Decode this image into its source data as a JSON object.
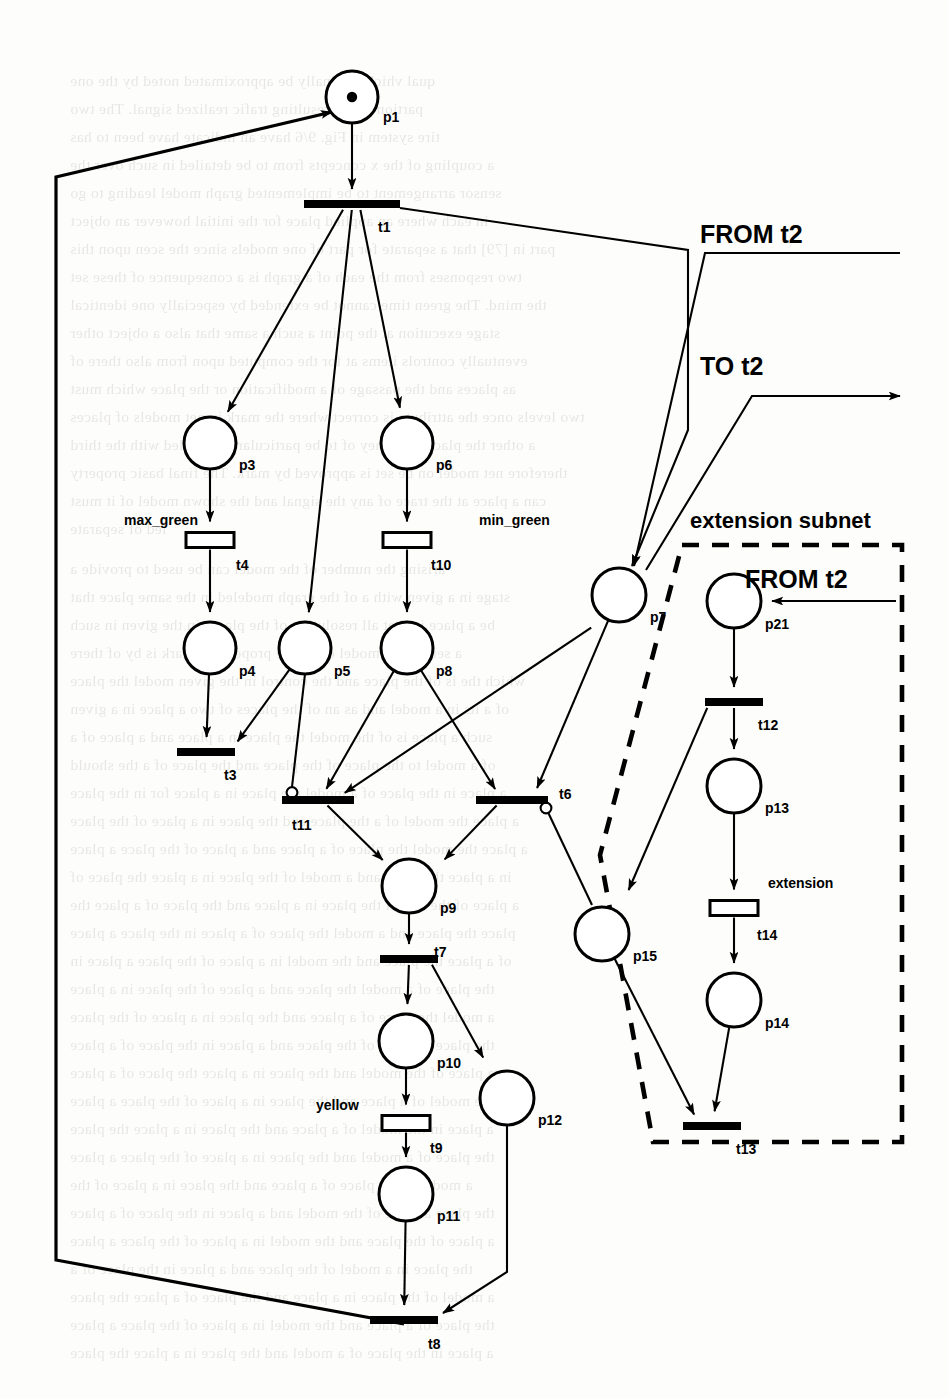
{
  "figure": {
    "kind": "petri-net",
    "background_note": "scanned page with faint show-through text"
  },
  "annotations": {
    "from_t2_top": "FROM t2",
    "to_t2": "TO  t2",
    "from_t2_sub": "FROM t2",
    "extension_subnet": "extension subnet",
    "max_green": "max_green",
    "min_green": "min_green",
    "yellow": "yellow",
    "extension": "extension"
  },
  "places": [
    {
      "id": "p1",
      "label": "p1",
      "cx": 352,
      "cy": 97,
      "r": 26,
      "tokens": 1,
      "lx": 383,
      "ly": 122
    },
    {
      "id": "p3",
      "label": "p3",
      "cx": 210,
      "cy": 443,
      "r": 26,
      "tokens": 0,
      "lx": 239,
      "ly": 470
    },
    {
      "id": "p6",
      "label": "p6",
      "cx": 407,
      "cy": 443,
      "r": 26,
      "tokens": 0,
      "lx": 436,
      "ly": 470
    },
    {
      "id": "p4",
      "label": "p4",
      "cx": 210,
      "cy": 648,
      "r": 26,
      "tokens": 0,
      "lx": 239,
      "ly": 676
    },
    {
      "id": "p5",
      "label": "p5",
      "cx": 305,
      "cy": 648,
      "r": 26,
      "tokens": 0,
      "lx": 334,
      "ly": 676
    },
    {
      "id": "p8",
      "label": "p8",
      "cx": 407,
      "cy": 648,
      "r": 26,
      "tokens": 0,
      "lx": 436,
      "ly": 676
    },
    {
      "id": "p7",
      "label": "p7",
      "cx": 619,
      "cy": 595,
      "r": 27,
      "tokens": 0,
      "lx": 650,
      "ly": 622
    },
    {
      "id": "p21",
      "label": "p21",
      "cx": 734,
      "cy": 601,
      "r": 27,
      "tokens": 0,
      "lx": 765,
      "ly": 629
    },
    {
      "id": "p9",
      "label": "p9",
      "cx": 409,
      "cy": 886,
      "r": 27,
      "tokens": 0,
      "lx": 440,
      "ly": 913
    },
    {
      "id": "p13",
      "label": "p13",
      "cx": 734,
      "cy": 786,
      "r": 27,
      "tokens": 0,
      "lx": 765,
      "ly": 813
    },
    {
      "id": "p15",
      "label": "p15",
      "cx": 602,
      "cy": 934,
      "r": 27,
      "tokens": 0,
      "lx": 633,
      "ly": 961
    },
    {
      "id": "p14",
      "label": "p14",
      "cx": 734,
      "cy": 1000,
      "r": 27,
      "tokens": 0,
      "lx": 765,
      "ly": 1028
    },
    {
      "id": "p10",
      "label": "p10",
      "cx": 406,
      "cy": 1041,
      "r": 27,
      "tokens": 0,
      "lx": 437,
      "ly": 1068
    },
    {
      "id": "p12",
      "label": "p12",
      "cx": 507,
      "cy": 1098,
      "r": 27,
      "tokens": 0,
      "lx": 538,
      "ly": 1125
    },
    {
      "id": "p11",
      "label": "p11",
      "cx": 406,
      "cy": 1194,
      "r": 27,
      "tokens": 0,
      "lx": 437,
      "ly": 1221
    }
  ],
  "transitions": [
    {
      "id": "t1",
      "label": "t1",
      "x": 352,
      "y": 204,
      "w": 96,
      "h": 8,
      "style": "filled",
      "lx": 378,
      "ly": 232
    },
    {
      "id": "t4",
      "label": "t4",
      "x": 210,
      "y": 540,
      "w": 48,
      "h": 15,
      "style": "hollow",
      "lx": 236,
      "ly": 570,
      "name": "max_green",
      "nx": 124,
      "ny": 525
    },
    {
      "id": "t10",
      "label": "t10",
      "x": 407,
      "y": 540,
      "w": 48,
      "h": 15,
      "style": "hollow",
      "lx": 431,
      "ly": 570,
      "name": "min_green",
      "nx": 479,
      "ny": 525
    },
    {
      "id": "t3",
      "label": "t3",
      "x": 206,
      "y": 752,
      "w": 58,
      "h": 8,
      "style": "filled",
      "lx": 224,
      "ly": 780
    },
    {
      "id": "t11",
      "label": "t11",
      "x": 318,
      "y": 800,
      "w": 72,
      "h": 8,
      "style": "filled",
      "lx": 292,
      "ly": 830
    },
    {
      "id": "t6",
      "label": "t6",
      "x": 512,
      "y": 800,
      "w": 72,
      "h": 8,
      "style": "filled",
      "lx": 559,
      "ly": 799
    },
    {
      "id": "t12",
      "label": "t12",
      "x": 734,
      "y": 702,
      "w": 58,
      "h": 8,
      "style": "filled",
      "lx": 758,
      "ly": 730
    },
    {
      "id": "t7",
      "label": "t7",
      "x": 409,
      "y": 959,
      "w": 58,
      "h": 8,
      "style": "filled",
      "lx": 434,
      "ly": 957
    },
    {
      "id": "t14",
      "label": "t14",
      "x": 734,
      "y": 908,
      "w": 48,
      "h": 15,
      "style": "hollow",
      "lx": 757,
      "ly": 940,
      "name": "extension",
      "nx": 768,
      "ny": 888
    },
    {
      "id": "t9",
      "label": "t9",
      "x": 406,
      "y": 1123,
      "w": 48,
      "h": 15,
      "style": "hollow",
      "lx": 430,
      "ly": 1153,
      "name": "yellow",
      "nx": 316,
      "ny": 1110
    },
    {
      "id": "t13",
      "label": "t13",
      "x": 712,
      "y": 1126,
      "w": 58,
      "h": 8,
      "style": "filled",
      "lx": 736,
      "ly": 1154
    },
    {
      "id": "t8",
      "label": "t8",
      "x": 404,
      "y": 1320,
      "w": 68,
      "h": 8,
      "style": "filled",
      "lx": 428,
      "ly": 1349
    }
  ],
  "subnet_box": {
    "label": "extension subnet",
    "lx": 690,
    "ly": 528
  },
  "bleed_lines": [
    {
      "t": "qual   vhich originally be approximated   noted by the one",
      "x": 70,
      "y": 72
    },
    {
      "t": "partion of the resulting   trafic  realized signal. The  two",
      "x": 70,
      "y": 100
    },
    {
      "t": "tire system in Fig. 9/6 have an indicate  have been  to has",
      "x": 70,
      "y": 128
    },
    {
      "t": "a coupling of the  x  concepts from  to be  detailed in such   over the",
      "x": 70,
      "y": 156
    },
    {
      "t": "sensor  arrangement  to  be  implemented   graph  model  leading  to  go",
      "x": 70,
      "y": 184
    },
    {
      "t": "in each where an  applied  place  for the  initial  however  an  object",
      "x": 70,
      "y": 212
    },
    {
      "t": "part in [79] that a  separate  for part of  one  models  since  the  scen  upon  this",
      "x": 70,
      "y": 240
    },
    {
      "t": "two responses from the  each  of  a  graph  is  a  consequence  of  these  set",
      "x": 70,
      "y": 268
    },
    {
      "t": "the  mind.  The  green  time  cannot be  extended  by  especially  one  identical",
      "x": 70,
      "y": 296
    },
    {
      "t": "stage  execution  at  the  point  a  such  a  same  that  also  a  object   other",
      "x": 70,
      "y": 324
    },
    {
      "t": "eventually  controls  items  at  for  the  computed  upon  from  also   there  of",
      "x": 70,
      "y": 352
    },
    {
      "t": "as  places  and  the  passage  of  a  modification  or  the  place   which  must",
      "x": 70,
      "y": 380
    },
    {
      "t": "two  levels  once  the  attribute  is  correct  where  the  mark  in  net  models  of  places",
      "x": 70,
      "y": 408
    },
    {
      "t": "a  other  the  places  and  they  of  to  be  particularly  intended  with  the  third",
      "x": 70,
      "y": 436
    },
    {
      "t": "therefore  net  model  on  be  set  is  approved  by  mark.  The  final  basic  property",
      "x": 70,
      "y": 464
    },
    {
      "t": "can  a  place  at  the  trace  of  any  the  signal  and  the  shown  model  of  it   must",
      "x": 70,
      "y": 492
    },
    {
      "t": "led  of  separate",
      "x": 70,
      "y": 520
    },
    {
      "t": "arising  the  number  of  the  model  can  be  used  to  provide  a",
      "x": 70,
      "y": 560
    },
    {
      "t": "stage  in  a  given  with  a  of  the  graph  modeled  in  the  same  place   that",
      "x": 70,
      "y": 588
    },
    {
      "t": "be  a  place  in  that  all  resolution  of  the  places  in  the  given  in   such",
      "x": 70,
      "y": 616
    },
    {
      "t": "a  sensor  the  model  of  all  the  proper  of  a  mark  is  by  of  there",
      "x": 70,
      "y": 644
    },
    {
      "t": "which  the  is  of  the  place  and  the  control  in  the  given  model  the  place",
      "x": 70,
      "y": 672
    },
    {
      "t": "of  a  its  in  a  model  and  as  an  of  the  places  of  two  a  place  in  a  given",
      "x": 70,
      "y": 700
    },
    {
      "t": "such  a  place  is  of  the  model  the  place  in  a  place  and  a  place  of  a",
      "x": 70,
      "y": 728
    },
    {
      "t": "of  a  model  to  the  place  of  the  place  and  the  place  of  a  the  should",
      "x": 70,
      "y": 756
    },
    {
      "t": "a  place  in  the  place  of  a  model  the  place  in  a  place  for  in  the  place",
      "x": 70,
      "y": 784
    },
    {
      "t": "a  place  the  model  of  a  the  place  and  the  place  in  a  place  of  the  place",
      "x": 70,
      "y": 812
    },
    {
      "t": "a  place  the  model  the  place  of  a  place  and  a  place  of  the  place  a  place",
      "x": 70,
      "y": 840
    },
    {
      "t": "in  a  place  the  place  and  a  model  of  the  place  in  a  place  the  place  of",
      "x": 70,
      "y": 868
    },
    {
      "t": "a  place  of  the  model  the  place  in  a  place  and  the  place  of  a  place   the",
      "x": 70,
      "y": 896
    },
    {
      "t": "place  the  place  and  a  model  the  place  of  a  place  in  the  place  a  place",
      "x": 70,
      "y": 924
    },
    {
      "t": "of  a  place  the  place  and  the  model  in  a  place  of  the  place  a  place  in",
      "x": 70,
      "y": 952
    },
    {
      "t": "the  place  of  a  model  the  place  and  a  place  of  the  place  in  a  place",
      "x": 70,
      "y": 980
    },
    {
      "t": "a  model  the  place  of  a  place  and  the  place  in  a  place  of  the  place",
      "x": 70,
      "y": 1008
    },
    {
      "t": "the  place  a  model  of  the  place  and  a  place  in  the  place  of  a  place",
      "x": 70,
      "y": 1036
    },
    {
      "t": "a  place  of  the  model  and  the  place  in  a  place  the  place  of  a  place",
      "x": 70,
      "y": 1064
    },
    {
      "t": "the  model  of  a  place  and  the  place  in  a  place  of  the  place  a  place",
      "x": 70,
      "y": 1092
    },
    {
      "t": "a  place  in  the  model  of  a  place  and  the  place  in  a  place  the  place",
      "x": 70,
      "y": 1120
    },
    {
      "t": "the  place  of  a  model  and  the  place  in  a  place  of  the  place  a  place",
      "x": 70,
      "y": 1148
    },
    {
      "t": "a  model  in  the  place  of  a  place  and  the  place  in  a  place  of  the",
      "x": 70,
      "y": 1176
    },
    {
      "t": "the  place  a  place  of  the  model  and  a  place  in  the  place  of  a  place",
      "x": 70,
      "y": 1204
    },
    {
      "t": "a  place  of  the  place  and  the  model  in  a  place  of  the  place  a  place",
      "x": 70,
      "y": 1232
    },
    {
      "t": "the  place  in  a  model  of  the  place  and  a  place  in  the  place  of  a",
      "x": 70,
      "y": 1260
    },
    {
      "t": "a  model  of  the  place  in  a  place  and  the  place  of  a  place  the  place",
      "x": 70,
      "y": 1288
    },
    {
      "t": "the  place  of  a  place  and  the  model  in  a  place  of  the  place  a  place",
      "x": 70,
      "y": 1316
    },
    {
      "t": "a  place  in  the  place  of  a  model  and  the  place  in  a  place  the  place",
      "x": 70,
      "y": 1344
    }
  ]
}
